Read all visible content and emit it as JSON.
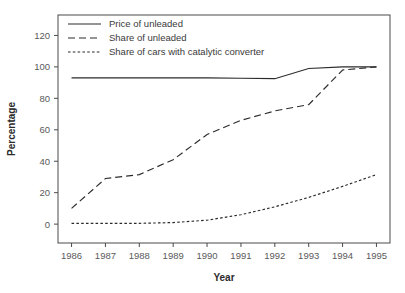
{
  "chart_data": {
    "type": "line",
    "title": "",
    "xlabel": "Year",
    "ylabel": "Percentage",
    "categories": [
      "1986",
      "1987",
      "1988",
      "1989",
      "1990",
      "1991",
      "1992",
      "1993",
      "1994",
      "1995"
    ],
    "x": [
      1986,
      1987,
      1988,
      1989,
      1990,
      1991,
      1992,
      1993,
      1994,
      1995
    ],
    "xlim": [
      1985.6,
      1995.4
    ],
    "ylim": [
      -12,
      133
    ],
    "yticks": [
      0,
      20,
      40,
      60,
      80,
      100,
      120
    ],
    "ytick_labels": [
      "0",
      "20",
      "40",
      "60",
      "80",
      "100",
      "120"
    ],
    "xtick_labels": [
      "1986",
      "1987",
      "1988",
      "1989",
      "1990",
      "1991",
      "1992",
      "1993",
      "1994",
      "1995"
    ],
    "grid": false,
    "legend_position": "top-left-inside",
    "series": [
      {
        "name": "Price of unleaded",
        "style": "solid",
        "values": [
          93,
          93,
          93,
          93,
          93,
          92.8,
          92.5,
          99,
          100,
          100
        ]
      },
      {
        "name": "Share of unleaded",
        "style": "long-dash",
        "values": [
          10,
          29,
          31.5,
          41,
          57,
          66,
          72,
          76,
          98,
          100
        ]
      },
      {
        "name": "Share of cars with catalytic converter",
        "style": "dotted",
        "values": [
          0.5,
          0.5,
          0.5,
          1,
          2.5,
          6,
          11,
          17,
          24,
          31.5
        ]
      }
    ]
  },
  "legend": {
    "items": [
      {
        "label": "Price of unleaded"
      },
      {
        "label": "Share of unleaded"
      },
      {
        "label": "Share of cars with catalytic converter"
      }
    ]
  },
  "axes": {
    "y_title": "Percentage",
    "x_title": "Year"
  }
}
